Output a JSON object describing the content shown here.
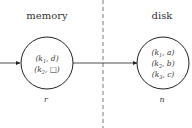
{
  "regions": {
    "memory": {
      "label": "memory"
    },
    "disk": {
      "label": "disk"
    }
  },
  "nodes": [
    {
      "id": "r",
      "label": "r",
      "entries": [
        "(k1, d)",
        "(k2, □)"
      ]
    },
    {
      "id": "n",
      "label": "n",
      "entries": [
        "(k1, a)",
        "(k2, b)",
        "(k3, c)"
      ]
    }
  ],
  "colors": {
    "stroke": "#222222",
    "text": "#333333",
    "divider": "#555555"
  }
}
